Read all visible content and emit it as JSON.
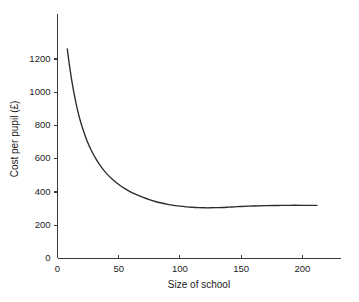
{
  "chart_data": {
    "type": "line",
    "title": "",
    "xlabel": "Size of school",
    "ylabel": "Cost per pupil (£)",
    "xlim": [
      0,
      225
    ],
    "ylim": [
      0,
      1320
    ],
    "xticks": [
      0,
      50,
      100,
      150,
      200
    ],
    "xtick_labels": [
      "0",
      "50",
      "100",
      "150",
      "200"
    ],
    "yticks": [
      0,
      200,
      400,
      600,
      800,
      1000,
      1200
    ],
    "ytick_labels": [
      "0",
      "200",
      "400",
      "600",
      "800",
      "1000",
      "1200"
    ],
    "grid": false,
    "legend": false,
    "legend_position": "none",
    "line_color": "#2b2b2b",
    "axis_color": "#3a3a3a",
    "background_color": "#ffffff",
    "series": [
      {
        "name": "Cost per pupil",
        "x": [
          8,
          10,
          12,
          14,
          16,
          18,
          20,
          24,
          28,
          32,
          36,
          40,
          45,
          50,
          55,
          60,
          65,
          70,
          75,
          80,
          85,
          90,
          95,
          100,
          105,
          110,
          115,
          120,
          125,
          130,
          135,
          140,
          145,
          150,
          160,
          170,
          180,
          190,
          200,
          212
        ],
        "y": [
          1260,
          1150,
          1055,
          975,
          905,
          845,
          795,
          710,
          645,
          592,
          548,
          512,
          475,
          445,
          420,
          399,
          382,
          367,
          354,
          343,
          334,
          326,
          320,
          315,
          311,
          308,
          306,
          305,
          305,
          306,
          307,
          309,
          311,
          313,
          316,
          318,
          319,
          320,
          320,
          320
        ]
      }
    ],
    "annotations": {
      "minimum_point": {
        "x": 100,
        "y": 315
      },
      "curve_start": {
        "x": 8,
        "y": 1260
      },
      "curve_end": {
        "x": 212,
        "y": 320
      },
      "shape": "U-shaped average cost curve: steep hyperbolic decline then flat plateau"
    }
  },
  "axes": {
    "y_axis_title": "Cost per pupil (£)",
    "x_axis_title": "Size of school"
  }
}
